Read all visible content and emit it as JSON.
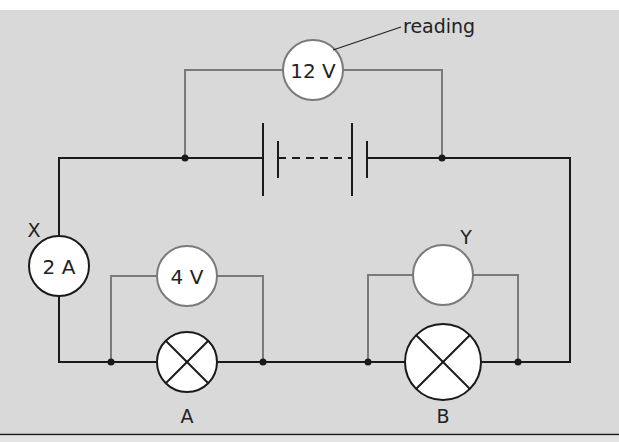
{
  "diagram": {
    "type": "circuit",
    "colors": {
      "background": "#d9d9d9",
      "wire": "#1a1a1a",
      "meter_wire": "#7a7a7a",
      "component_fill": "#ffffff",
      "page_top": "#ffffff",
      "bottom_rule": "#1a1a1a"
    },
    "voltmeter_top": {
      "reading": "12 V",
      "annotation": "reading"
    },
    "ammeter": {
      "label": "X",
      "reading": "2 A"
    },
    "voltmeter_a": {
      "reading": "4 V"
    },
    "voltmeter_b": {
      "label": "Y",
      "reading": ""
    },
    "lamp_a": {
      "label": "A"
    },
    "lamp_b": {
      "label": "B"
    },
    "battery": {
      "description": "multi-cell battery"
    }
  }
}
